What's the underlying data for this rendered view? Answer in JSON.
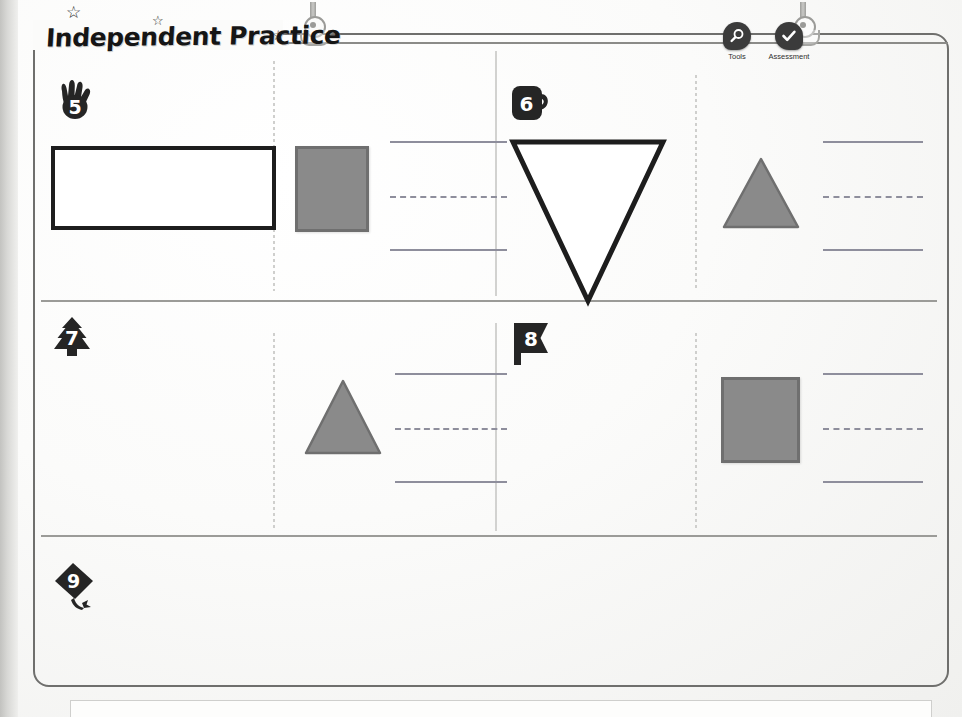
{
  "page": {
    "title": "Independent Practice",
    "decorations": {
      "stars": [
        "☆",
        "☆",
        "☆"
      ]
    }
  },
  "toolbar": {
    "items": [
      {
        "label": "Tools",
        "icon": "tools-magnifier-icon"
      },
      {
        "label": "Assessment",
        "icon": "assessment-check-icon"
      }
    ]
  },
  "colors": {
    "shape_fill": "#8a8a8a",
    "shape_stroke": "#6f6f6f",
    "outline_stroke": "#1d1d1d",
    "line_color": "#8e8e9c",
    "frame": "#6f6f6d",
    "badge": "#252525"
  },
  "problems": [
    {
      "number": "5",
      "badge_icon": "hand-badge-icon",
      "prompt_shape": {
        "type": "rectangle",
        "style": "outline",
        "fill": "#ffffff",
        "stroke": "#1d1d1d"
      },
      "answer_shape": {
        "type": "square",
        "style": "filled",
        "fill": "#8a8a8a",
        "stroke": "#6f6f6f"
      },
      "answer_lines": [
        "solid",
        "dashed",
        "solid"
      ]
    },
    {
      "number": "6",
      "badge_icon": "mug-badge-icon",
      "prompt_shape": {
        "type": "triangle-down",
        "style": "outline",
        "fill": "#ffffff",
        "stroke": "#1d1d1d"
      },
      "answer_shape": {
        "type": "triangle-up",
        "style": "filled",
        "fill": "#8a8a8a",
        "stroke": "#6f6f6f"
      },
      "answer_lines": [
        "solid",
        "dashed",
        "solid"
      ]
    },
    {
      "number": "7",
      "badge_icon": "tree-badge-icon",
      "prompt_shape": null,
      "answer_shape": {
        "type": "triangle-up",
        "style": "filled",
        "fill": "#8a8a8a",
        "stroke": "#6f6f6f"
      },
      "answer_lines": [
        "solid",
        "dashed",
        "solid"
      ]
    },
    {
      "number": "8",
      "badge_icon": "flag-badge-icon",
      "prompt_shape": null,
      "answer_shape": {
        "type": "square",
        "style": "filled",
        "fill": "#8a8a8a",
        "stroke": "#6f6f6f"
      },
      "answer_lines": [
        "solid",
        "dashed",
        "solid"
      ]
    },
    {
      "number": "9",
      "badge_icon": "kite-badge-icon",
      "prompt_shape": null,
      "answer_shape": null,
      "answer_lines": []
    }
  ]
}
